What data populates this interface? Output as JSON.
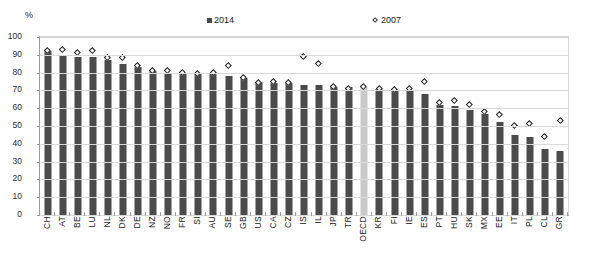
{
  "chart_data": {
    "type": "bar",
    "title": "",
    "subtitle": "",
    "xlabel": "",
    "ylabel": "%",
    "ylim": [
      0,
      100
    ],
    "yticks": [
      0,
      10,
      20,
      30,
      40,
      50,
      60,
      70,
      80,
      90,
      100
    ],
    "grid": true,
    "legend_position": "top-center",
    "categories": [
      "CH",
      "AT",
      "BE",
      "LU",
      "NL",
      "DK",
      "DE",
      "NZ",
      "NO",
      "FR",
      "SI",
      "AU",
      "SE",
      "GB",
      "US",
      "CA",
      "CZ",
      "IS",
      "IL",
      "JP",
      "TR",
      "OECD",
      "KR",
      "FI",
      "IE",
      "ES",
      "PT",
      "HU",
      "SK",
      "MX",
      "EE",
      "IT",
      "PL",
      "CL",
      "GR"
    ],
    "highlight_category": "OECD",
    "series": [
      {
        "name": "2014",
        "marker": "bar",
        "color": "#4b4b4b",
        "highlight_color": "#c9c9c9",
        "values": [
          92,
          90,
          89,
          89,
          87,
          85,
          83,
          81,
          80,
          80,
          80,
          79,
          78,
          77,
          75,
          74,
          74,
          73,
          73,
          72,
          72,
          72,
          71,
          70,
          70,
          68,
          62,
          61,
          59,
          57,
          52,
          45,
          44,
          37,
          36
        ]
      },
      {
        "name": "2007",
        "marker": "diamond",
        "color": "#1f1f1f",
        "values": [
          92,
          93,
          91,
          92,
          88,
          88,
          84,
          81,
          81,
          80,
          79,
          80,
          84,
          77,
          74,
          75,
          74,
          89,
          85,
          72,
          71,
          72,
          71,
          70,
          71,
          75,
          63,
          64,
          62,
          58,
          56,
          50,
          51,
          44,
          53
        ]
      }
    ]
  },
  "axis": {
    "unit_label": "%"
  },
  "legend": {
    "items": [
      {
        "label": "2014",
        "marker": "square"
      },
      {
        "label": "2007",
        "marker": "diamond"
      }
    ]
  }
}
